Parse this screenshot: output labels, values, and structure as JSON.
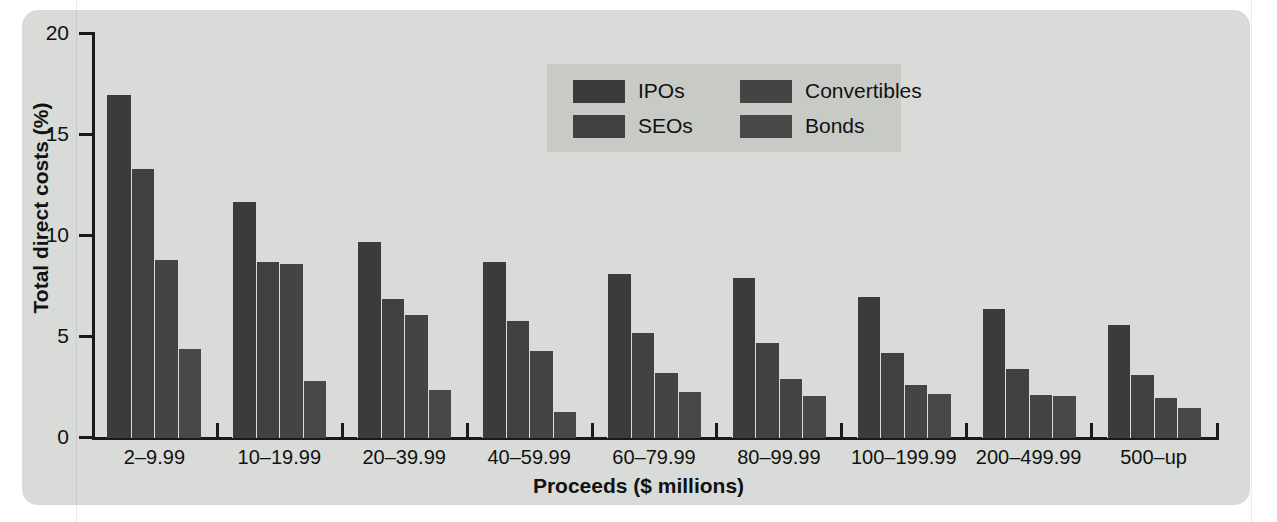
{
  "chart_data": {
    "type": "bar",
    "title": "",
    "xlabel": "Proceeds ($ millions)",
    "ylabel": "Total direct costs (%)",
    "ylim": [
      0,
      20
    ],
    "yticks": [
      0,
      5,
      10,
      15,
      20
    ],
    "ytick_labels": [
      "0",
      "5",
      "10",
      "15",
      "20"
    ],
    "grid": false,
    "legend_position": "top-center",
    "categories": [
      "2–9.99",
      "10–19.99",
      "20–39.99",
      "40–59.99",
      "60–79.99",
      "80–99.99",
      "100–199.99",
      "200–499.99",
      "500–up"
    ],
    "series": [
      {
        "name": "IPOs",
        "color": "#3b3b3b",
        "values": [
          17.0,
          11.7,
          9.7,
          8.7,
          8.1,
          7.9,
          7.0,
          6.4,
          5.6
        ]
      },
      {
        "name": "SEOs",
        "color": "#414141",
        "values": [
          13.3,
          8.7,
          6.9,
          5.8,
          5.2,
          4.7,
          4.2,
          3.4,
          3.1
        ]
      },
      {
        "name": "Convertibles",
        "color": "#444444",
        "values": [
          8.8,
          8.6,
          6.1,
          4.3,
          3.2,
          2.9,
          2.6,
          2.15,
          2.0
        ]
      },
      {
        "name": "Bonds",
        "color": "#484848",
        "values": [
          4.4,
          2.8,
          2.4,
          1.3,
          2.3,
          2.1,
          2.2,
          2.1,
          1.5
        ]
      }
    ]
  },
  "legend": {
    "entries": [
      "IPOs",
      "SEOs",
      "Convertibles",
      "Bonds"
    ],
    "order": [
      0,
      1,
      2,
      3
    ]
  },
  "colors": {
    "panel_background": "#d9dbd8",
    "legend_background": "#c8cac6",
    "axis": "#1a1a1a",
    "text": "#111111"
  }
}
